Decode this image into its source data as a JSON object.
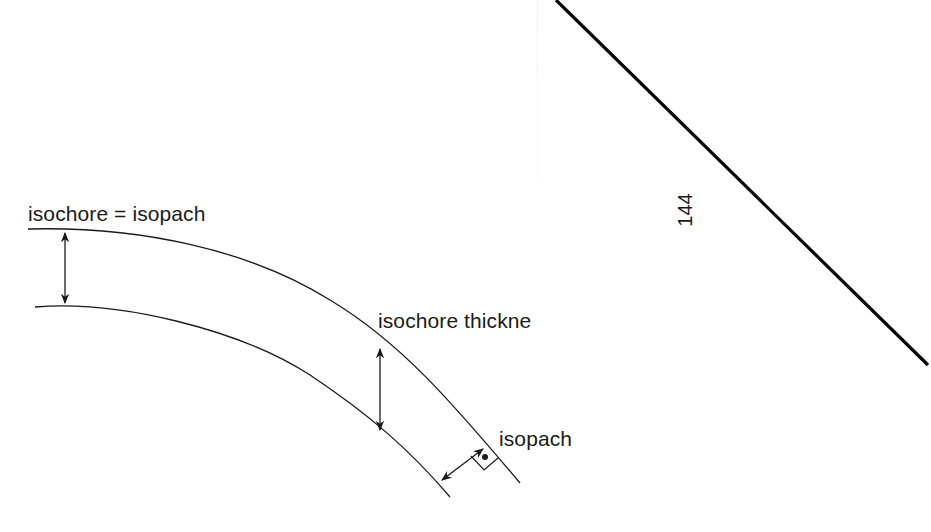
{
  "diagram": {
    "labels": {
      "isochore_equals_isopach": "isochore = isopach",
      "isochore_thickness": "isochore thickne",
      "isopach": "isopach"
    },
    "page_number": "144",
    "layers": {
      "upper_boundary": "top surface of bed",
      "lower_boundary": "base of bed"
    },
    "measurements": [
      {
        "name": "isochore = isopach",
        "type": "vertical",
        "location": "flat limb"
      },
      {
        "name": "isochore thickness",
        "type": "vertical",
        "location": "dipping limb"
      },
      {
        "name": "isopach",
        "type": "perpendicular to bedding",
        "location": "dipping limb",
        "marker": "right-angle"
      }
    ],
    "colors": {
      "line": "#1a1a1a",
      "background": "#ffffff",
      "page_edge": "#000000"
    }
  }
}
